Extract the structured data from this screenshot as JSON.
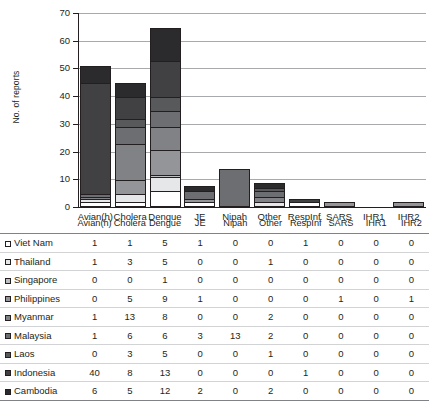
{
  "chart_data": {
    "type": "bar",
    "subtype": "stacked-bar",
    "title": "",
    "xlabel": "",
    "ylabel": "No. of reports",
    "ylim": [
      0,
      70
    ],
    "ytick_values": [
      0,
      10,
      20,
      30,
      40,
      50,
      60,
      70
    ],
    "grid": true,
    "legend_position": "table-rows",
    "categories": [
      "Avian(h)",
      "Cholera",
      "Dengue",
      "JE",
      "Nipah",
      "Other",
      "RespInf",
      "SARS",
      "IHR1",
      "IHR2"
    ],
    "series": [
      {
        "name": "Viet Nam",
        "color": "#ffffff",
        "values": [
          1,
          1,
          5,
          1,
          0,
          0,
          1,
          0,
          0,
          0
        ]
      },
      {
        "name": "Thailand",
        "color": "#e6e7e8",
        "values": [
          1,
          3,
          5,
          0,
          0,
          1,
          0,
          0,
          0,
          0
        ]
      },
      {
        "name": "Singapore",
        "color": "#bcbec0",
        "values": [
          0,
          0,
          1,
          0,
          0,
          0,
          0,
          0,
          0,
          0
        ]
      },
      {
        "name": "Philippines",
        "color": "#939598",
        "values": [
          0,
          5,
          9,
          1,
          0,
          0,
          0,
          1,
          0,
          1
        ]
      },
      {
        "name": "Myanmar",
        "color": "#808285",
        "values": [
          1,
          13,
          8,
          0,
          0,
          2,
          0,
          0,
          0,
          0
        ]
      },
      {
        "name": "Malaysia",
        "color": "#6d6e71",
        "values": [
          1,
          6,
          6,
          3,
          13,
          2,
          0,
          0,
          0,
          0
        ]
      },
      {
        "name": "Laos",
        "color": "#58595b",
        "values": [
          0,
          3,
          5,
          0,
          0,
          1,
          0,
          0,
          0,
          0
        ]
      },
      {
        "name": "Indonesia",
        "color": "#414042",
        "values": [
          40,
          8,
          13,
          0,
          0,
          0,
          1,
          0,
          0,
          0
        ]
      },
      {
        "name": "Cambodia",
        "color": "#2b2a2c",
        "values": [
          6,
          5,
          12,
          2,
          0,
          2,
          0,
          0,
          0,
          0
        ]
      }
    ],
    "column_totals": [
      50,
      44,
      64,
      7,
      13,
      8,
      2,
      1,
      0,
      1
    ]
  },
  "table": {
    "corner_label": "",
    "columns": [
      "Avian(h)",
      "Cholera",
      "Dengue",
      "JE",
      "Nipah",
      "Other",
      "RespInf",
      "SARS",
      "IHR1",
      "IHR2"
    ],
    "rows": [
      {
        "label": "Viet Nam",
        "swatch": "#ffffff",
        "values": [
          "1",
          "1",
          "5",
          "1",
          "0",
          "0",
          "1",
          "0",
          "0",
          "0"
        ]
      },
      {
        "label": "Thailand",
        "swatch": "#e6e7e8",
        "values": [
          "1",
          "3",
          "5",
          "0",
          "0",
          "1",
          "0",
          "0",
          "0",
          "0"
        ]
      },
      {
        "label": "Singapore",
        "swatch": "#bcbec0",
        "values": [
          "0",
          "0",
          "1",
          "0",
          "0",
          "0",
          "0",
          "0",
          "0",
          "0"
        ]
      },
      {
        "label": "Philippines",
        "swatch": "#939598",
        "values": [
          "0",
          "5",
          "9",
          "1",
          "0",
          "0",
          "0",
          "1",
          "0",
          "1"
        ]
      },
      {
        "label": "Myanmar",
        "swatch": "#808285",
        "values": [
          "1",
          "13",
          "8",
          "0",
          "0",
          "2",
          "0",
          "0",
          "0",
          "0"
        ]
      },
      {
        "label": "Malaysia",
        "swatch": "#6d6e71",
        "values": [
          "1",
          "6",
          "6",
          "3",
          "13",
          "2",
          "0",
          "0",
          "0",
          "0"
        ]
      },
      {
        "label": "Laos",
        "swatch": "#58595b",
        "values": [
          "0",
          "3",
          "5",
          "0",
          "0",
          "1",
          "0",
          "0",
          "0",
          "0"
        ]
      },
      {
        "label": "Indonesia",
        "swatch": "#414042",
        "values": [
          "40",
          "8",
          "13",
          "0",
          "0",
          "0",
          "1",
          "0",
          "0",
          "0"
        ]
      },
      {
        "label": "Cambodia",
        "swatch": "#2b2a2c",
        "values": [
          "6",
          "5",
          "12",
          "2",
          "0",
          "2",
          "0",
          "0",
          "0",
          "0"
        ]
      }
    ]
  }
}
